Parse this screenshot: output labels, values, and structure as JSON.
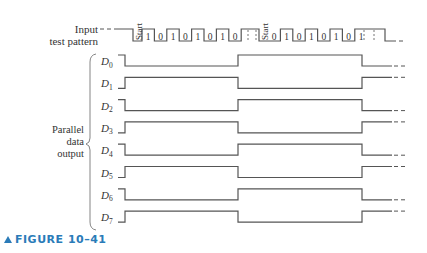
{
  "figure": {
    "caption": "FIGURE 10–41",
    "accent_color": "#2a7bb8"
  },
  "input": {
    "label_line1": "Input",
    "label_line2": "test pattern",
    "frames": [
      {
        "start_label": "Start",
        "bits": [
          "1",
          "0",
          "1",
          "0",
          "1",
          "0",
          "1",
          "0"
        ]
      },
      {
        "start_label": "Start",
        "bits": [
          "0",
          "1",
          "0",
          "1",
          "0",
          "1",
          "0",
          "1"
        ]
      }
    ]
  },
  "output_group_label": [
    "Parallel",
    "data",
    "output"
  ],
  "outputs": [
    {
      "name": "D",
      "sub": "0",
      "pattern": [
        1,
        0,
        1,
        0
      ]
    },
    {
      "name": "D",
      "sub": "1",
      "pattern": [
        0,
        1,
        0,
        1
      ]
    },
    {
      "name": "D",
      "sub": "2",
      "pattern": [
        1,
        0,
        1,
        0
      ]
    },
    {
      "name": "D",
      "sub": "3",
      "pattern": [
        0,
        1,
        0,
        1
      ]
    },
    {
      "name": "D",
      "sub": "4",
      "pattern": [
        1,
        0,
        1,
        0
      ]
    },
    {
      "name": "D",
      "sub": "5",
      "pattern": [
        0,
        1,
        0,
        1
      ]
    },
    {
      "name": "D",
      "sub": "6",
      "pattern": [
        1,
        0,
        1,
        0
      ]
    },
    {
      "name": "D",
      "sub": "7",
      "pattern": [
        0,
        1,
        0,
        1
      ]
    }
  ],
  "line_color": "#555555"
}
